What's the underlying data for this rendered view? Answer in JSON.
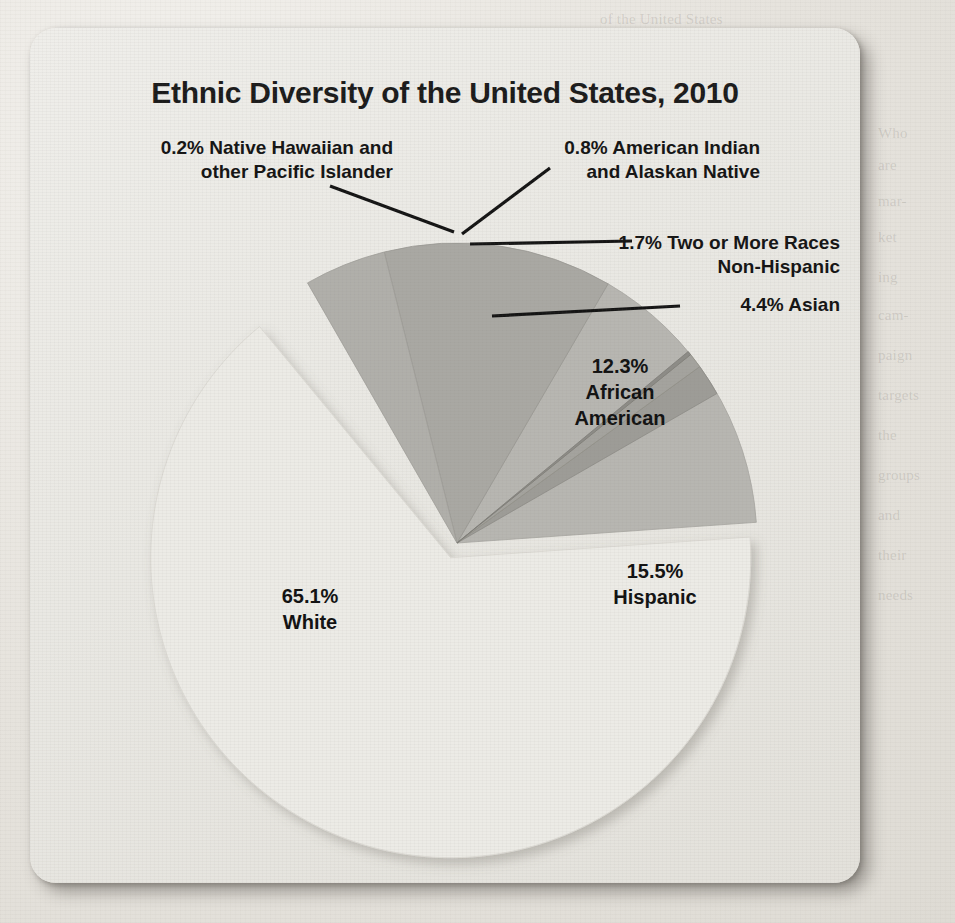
{
  "figure": {
    "title": "Ethnic Diversity of the United States, 2010"
  },
  "labels": {
    "hawaiian_l1": "0.2% Native Hawaiian and",
    "hawaiian_l2": "other Pacific Islander",
    "amerindian_l1": "0.8% American Indian",
    "amerindian_l2": "and Alaskan Native",
    "tworaces_l1": "1.7% Two or More Races",
    "tworaces_l2": "Non-Hispanic",
    "asian": "4.4% Asian",
    "african_l1": "12.3%",
    "african_l2": "African",
    "african_l3": "American",
    "hispanic_l1": "15.5%",
    "hispanic_l2": "Hispanic",
    "white_l1": "65.1%",
    "white_l2": "White"
  },
  "colors": {
    "white_slice": "#ecebe6",
    "hispanic_slice": "#b7b6b1",
    "african_slice": "#a9a8a3",
    "asian_slice": "#b0afaa",
    "tworaces_slice": "#9d9c97",
    "amerindian_slice": "#a4a39e",
    "hawaiian_slice": "#8d8c87",
    "leader_line": "#141414",
    "title_text": "#1b1b1b",
    "card_bg": "#eae9e4",
    "page_bg": "#e6e3dd"
  },
  "chart_data": {
    "type": "pie",
    "title": "Ethnic Diversity of the United States, 2010",
    "xlabel": "",
    "ylabel": "",
    "units": "percent",
    "total": 100.0,
    "legend_position": "none (direct labels with leader lines)",
    "grid": false,
    "exploded_slices": [
      "White"
    ],
    "start_angle_deg": 0,
    "direction": "clockwise",
    "categories": [
      "Native Hawaiian and other Pacific Islander",
      "American Indian and Alaskan Native",
      "Two or More Races Non-Hispanic",
      "Asian",
      "African American",
      "Hispanic",
      "White"
    ],
    "values": [
      0.2,
      0.8,
      1.7,
      4.4,
      12.3,
      15.5,
      65.1
    ],
    "slices": [
      {
        "label": "Native Hawaiian and other Pacific Islander",
        "value": 0.2,
        "display": "0.2%",
        "color": "#8d8c87",
        "label_placement": "outside-left"
      },
      {
        "label": "American Indian and Alaskan Native",
        "value": 0.8,
        "display": "0.8%",
        "color": "#a4a39e",
        "label_placement": "outside-right"
      },
      {
        "label": "Two or More Races Non-Hispanic",
        "value": 1.7,
        "display": "1.7%",
        "color": "#9d9c97",
        "label_placement": "outside-right"
      },
      {
        "label": "Asian",
        "value": 4.4,
        "display": "4.4%",
        "color": "#b0afaa",
        "label_placement": "outside-right"
      },
      {
        "label": "African American",
        "value": 12.3,
        "display": "12.3%",
        "color": "#a9a8a3",
        "label_placement": "inside"
      },
      {
        "label": "Hispanic",
        "value": 15.5,
        "display": "15.5%",
        "color": "#b7b6b1",
        "label_placement": "inside"
      },
      {
        "label": "White",
        "value": 65.1,
        "display": "65.1%",
        "color": "#ecebe6",
        "label_placement": "inside"
      }
    ]
  }
}
